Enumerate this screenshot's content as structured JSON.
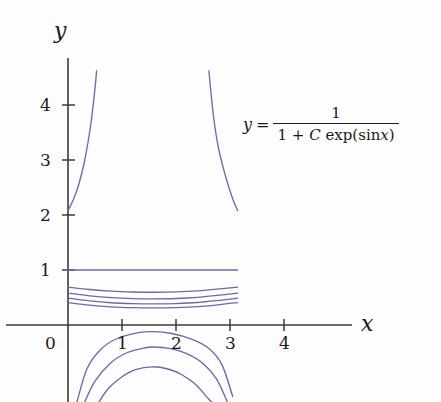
{
  "figure": {
    "background_color": "#fdfdfd",
    "curve_color": "#6b6ba5",
    "axis_color": "#3a3a3a"
  },
  "annotation": {
    "lhs": "y",
    "equals": "=",
    "numerator": "1",
    "denominator_a": "1 +",
    "denominator_c": "C",
    "denominator_exp": "exp(sin",
    "denominator_x": "x",
    "denominator_close": ")",
    "full_text": "y = 1 / (1 + C exp(sin x))"
  },
  "chart_data": {
    "type": "line",
    "title": "",
    "subtitle": "",
    "xlabel": "x",
    "ylabel": "y",
    "xlim": [
      -0.25,
      5.3
    ],
    "ylim": [
      -1.4,
      4.9
    ],
    "xticks": [
      0,
      1,
      2,
      3,
      4
    ],
    "xticklabels": [
      "0",
      "1",
      "2",
      "3",
      "4"
    ],
    "yticks": [
      1,
      2,
      3,
      4
    ],
    "yticklabels": [
      "1",
      "2",
      "3",
      "4"
    ],
    "grid": false,
    "legend": null,
    "annotations": [
      {
        "text": "y = 1 / (1 + C exp(sin x))",
        "x": 3.3,
        "y": 4.0
      }
    ],
    "equation": "y = 1/(1 + C*exp(sin(x)))",
    "x_domain_of_curves": [
      0,
      3.1416
    ],
    "series": [
      {
        "name": "C = 0",
        "C": 0,
        "description": "horizontal line y = 1",
        "style": "solid",
        "color": "#6b6ba5",
        "points": [
          [
            0.0,
            1.0
          ],
          [
            0.5,
            1.0
          ],
          [
            1.0,
            1.0
          ],
          [
            1.5,
            1.0
          ],
          [
            2.0,
            1.0
          ],
          [
            2.5,
            1.0
          ],
          [
            3.0,
            1.0
          ],
          [
            3.1416,
            1.0
          ]
        ]
      },
      {
        "name": "C = 0.45",
        "C": 0.45,
        "description": "dips below y = 1, minimum near x = pi/2",
        "style": "solid",
        "color": "#6b6ba5",
        "points": [
          [
            0.0,
            0.69
          ],
          [
            0.4,
            0.646
          ],
          [
            0.8,
            0.615
          ],
          [
            1.2,
            0.6
          ],
          [
            1.5708,
            0.596
          ],
          [
            2.0,
            0.601
          ],
          [
            2.4,
            0.62
          ],
          [
            2.8,
            0.656
          ],
          [
            3.1416,
            0.69
          ]
        ]
      },
      {
        "name": "C = 0.72",
        "C": 0.72,
        "description": "second decaying curve below y = 1",
        "style": "solid",
        "color": "#6b6ba5",
        "points": [
          [
            0.0,
            0.581
          ],
          [
            0.4,
            0.531
          ],
          [
            0.8,
            0.497
          ],
          [
            1.2,
            0.48
          ],
          [
            1.5708,
            0.476
          ],
          [
            2.0,
            0.482
          ],
          [
            2.4,
            0.502
          ],
          [
            2.8,
            0.542
          ],
          [
            3.1416,
            0.581
          ]
        ]
      },
      {
        "name": "C = 1.05",
        "C": 1.05,
        "description": "third decaying curve below y = 1",
        "style": "solid",
        "color": "#6b6ba5",
        "points": [
          [
            0.0,
            0.488
          ],
          [
            0.4,
            0.438
          ],
          [
            0.8,
            0.405
          ],
          [
            1.2,
            0.389
          ],
          [
            1.5708,
            0.384
          ],
          [
            2.0,
            0.39
          ],
          [
            2.4,
            0.409
          ],
          [
            2.8,
            0.448
          ],
          [
            3.1416,
            0.488
          ]
        ]
      },
      {
        "name": "C = 1.45",
        "C": 1.45,
        "description": "fourth decaying curve, lowest above the x-axis",
        "style": "solid",
        "color": "#6b6ba5",
        "points": [
          [
            0.0,
            0.408
          ],
          [
            0.4,
            0.361
          ],
          [
            0.8,
            0.331
          ],
          [
            1.2,
            0.316
          ],
          [
            1.5708,
            0.312
          ],
          [
            2.0,
            0.317
          ],
          [
            2.4,
            0.334
          ],
          [
            2.8,
            0.37
          ],
          [
            3.1416,
            0.408
          ]
        ]
      },
      {
        "name": "C = -0.52 (upper-left branch)",
        "C": -0.52,
        "description": "branch rising from (0, 2.08) off the top of the frame",
        "style": "solid",
        "color": "#6b6ba5",
        "points": [
          [
            0.0,
            2.08
          ],
          [
            0.1,
            2.28
          ],
          [
            0.2,
            2.56
          ],
          [
            0.3,
            2.95
          ],
          [
            0.4,
            3.5
          ],
          [
            0.45,
            3.86
          ],
          [
            0.5,
            4.3
          ],
          [
            0.53,
            4.62
          ]
        ]
      },
      {
        "name": "C = -0.52 (upper-right branch)",
        "C": -0.52,
        "description": "branch falling from the top of the frame to (pi, 2.08)",
        "style": "solid",
        "color": "#6b6ba5",
        "points": [
          [
            2.61,
            4.62
          ],
          [
            2.64,
            4.3
          ],
          [
            2.7,
            3.75
          ],
          [
            2.78,
            3.25
          ],
          [
            2.88,
            2.84
          ],
          [
            2.98,
            2.5
          ],
          [
            3.06,
            2.27
          ],
          [
            3.1416,
            2.08
          ]
        ]
      },
      {
        "name": "C = -1.6 (lower arc 1)",
        "C": -1.6,
        "description": "arc below the x-axis peaking near y = -0.1",
        "style": "solid",
        "color": "#6b6ba5",
        "points": [
          [
            0.16,
            -1.42
          ],
          [
            0.35,
            -0.8
          ],
          [
            0.6,
            -0.45
          ],
          [
            0.9,
            -0.25
          ],
          [
            1.3,
            -0.14
          ],
          [
            1.5708,
            -0.12
          ],
          [
            1.9,
            -0.15
          ],
          [
            2.3,
            -0.26
          ],
          [
            2.6,
            -0.42
          ],
          [
            2.85,
            -0.72
          ],
          [
            3.05,
            -1.3
          ]
        ]
      },
      {
        "name": "C = -2.1 (lower arc 2)",
        "C": -2.1,
        "description": "arc below the x-axis peaking near y = -0.38",
        "style": "solid",
        "color": "#6b6ba5",
        "points": [
          [
            0.3,
            -1.42
          ],
          [
            0.5,
            -1.02
          ],
          [
            0.8,
            -0.68
          ],
          [
            1.1,
            -0.5
          ],
          [
            1.4,
            -0.42
          ],
          [
            1.5708,
            -0.4
          ],
          [
            1.9,
            -0.43
          ],
          [
            2.2,
            -0.52
          ],
          [
            2.5,
            -0.7
          ],
          [
            2.75,
            -0.98
          ],
          [
            2.95,
            -1.4
          ]
        ]
      },
      {
        "name": "C = -3.0 (lower arc 3)",
        "C": -3.0,
        "description": "innermost arc below the x-axis peaking near y = -0.72",
        "style": "solid",
        "color": "#6b6ba5",
        "points": [
          [
            0.56,
            -1.42
          ],
          [
            0.75,
            -1.15
          ],
          [
            1.0,
            -0.94
          ],
          [
            1.25,
            -0.81
          ],
          [
            1.5708,
            -0.76
          ],
          [
            1.85,
            -0.8
          ],
          [
            2.1,
            -0.9
          ],
          [
            2.35,
            -1.07
          ],
          [
            2.6,
            -1.34
          ],
          [
            2.68,
            -1.42
          ]
        ]
      }
    ]
  }
}
